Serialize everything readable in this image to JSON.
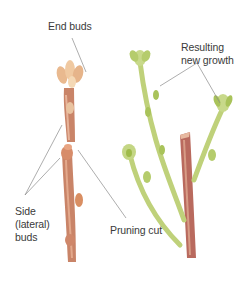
{
  "diagram": {
    "colors": {
      "background": "#ffffff",
      "bark": "#c98468",
      "bark_dark": "#a45a4a",
      "bud": "#e9b98f",
      "new_growth": "#bfd17a",
      "new_growth_dark": "#98b24a",
      "leader_line": "#8a8a8a",
      "text": "#3a3a3a"
    },
    "labels": {
      "end_buds": "End buds",
      "side_buds": [
        "Side",
        "(lateral)",
        "buds"
      ],
      "pruning_cut": "Pruning cut",
      "resulting_growth": [
        "Resulting",
        "new growth"
      ]
    },
    "figures": [
      {
        "name": "before-pruning-stem",
        "description": "Reddish-brown twig with end buds on top and side buds; cut point indicated"
      },
      {
        "name": "after-pruning-stem",
        "description": "Reddish-brown stem with two green new shoots emerging below the cut"
      }
    ]
  }
}
